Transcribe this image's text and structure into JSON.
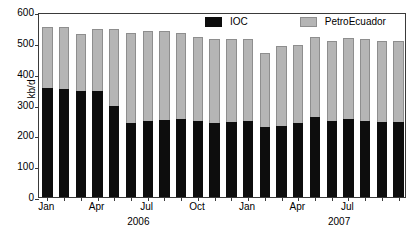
{
  "chart_data": {
    "type": "bar",
    "title": "",
    "subtitle": "",
    "xlabel": "",
    "ylabel": "kb/d",
    "stacked": true,
    "grid": false,
    "legend_position": "top-right",
    "ylim": [
      0,
      600
    ],
    "yticks": [
      0,
      100,
      200,
      300,
      400,
      500,
      600
    ],
    "ytick_labels": [
      "0",
      "100",
      "200",
      "300",
      "400",
      "500",
      "600"
    ],
    "categories": [
      "Jan 2006",
      "Feb 2006",
      "Mar 2006",
      "Apr 2006",
      "May 2006",
      "Jun 2006",
      "Jul 2006",
      "Aug 2006",
      "Sep 2006",
      "Oct 2006",
      "Nov 2006",
      "Dec 2006",
      "Jan 2007",
      "Feb 2007",
      "Mar 2007",
      "Apr 2007",
      "May 2007",
      "Jun 2007",
      "Jul 2007",
      "Aug 2007",
      "Sep 2007",
      "Oct 2007"
    ],
    "xtick_labels": [
      "Jan",
      "Apr",
      "Jul",
      "Oct",
      "Jan",
      "Apr",
      "Jul"
    ],
    "xtick_category_index": [
      0,
      3,
      6,
      9,
      12,
      15,
      18
    ],
    "year_labels": [
      "2006",
      "2007"
    ],
    "year_label_category_index": [
      5.5,
      17.5
    ],
    "series": [
      {
        "name": "IOC",
        "color": "#0d0d0d",
        "values": [
          355,
          350,
          344,
          344,
          295,
          241,
          248,
          250,
          252,
          245,
          239,
          244,
          248,
          228,
          229,
          241,
          258,
          248,
          252,
          245,
          242,
          242
        ]
      },
      {
        "name": "PetroEcuador",
        "color": "#b5b5b5",
        "values": [
          195,
          200,
          184,
          200,
          249,
          291,
          291,
          288,
          279,
          273,
          273,
          270,
          264,
          238,
          262,
          252,
          262,
          258,
          263,
          267,
          264,
          263
        ]
      }
    ],
    "totals": [
      550,
      550,
      528,
      544,
      544,
      532,
      539,
      538,
      531,
      518,
      512,
      514,
      512,
      466,
      491,
      493,
      520,
      506,
      515,
      512,
      506,
      505
    ]
  },
  "legend": {
    "items": [
      {
        "label": "IOC",
        "swatch": "ioc"
      },
      {
        "label": "PetroEcuador",
        "swatch": "petro"
      }
    ]
  }
}
